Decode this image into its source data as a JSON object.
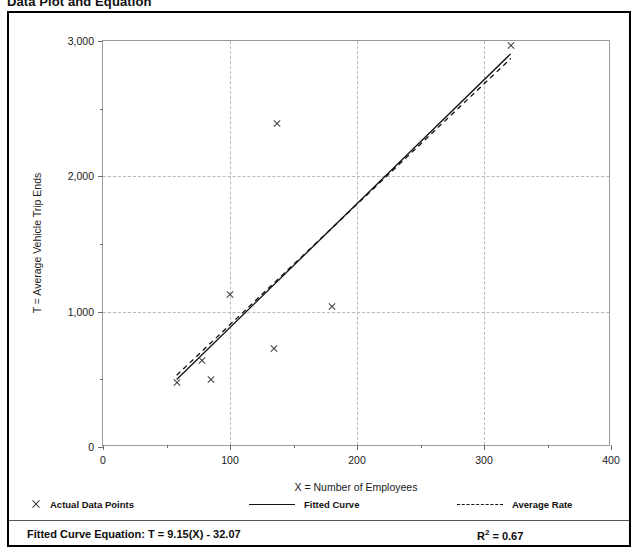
{
  "title": "Data Plot and Equation",
  "axes": {
    "x_title": "X = Number of Employees",
    "y_title": "T = Average Vehicle Trip Ends",
    "x_ticks": [
      "0",
      "100",
      "200",
      "300",
      "400"
    ],
    "y_ticks": [
      "0",
      "1,000",
      "2,000",
      "3,000"
    ]
  },
  "legend": {
    "items": [
      {
        "label": "Actual Data Points",
        "marker": "x-marker"
      },
      {
        "label": "Fitted Curve",
        "marker": "solid-line"
      },
      {
        "label": "Average Rate",
        "marker": "dashed-line"
      }
    ]
  },
  "footer": {
    "equation_label": "Fitted Curve Equation:  T = 9.15(X) - 32.07",
    "r2_label": "R",
    "r2_sup": "2",
    "r2_value": " = 0.67"
  },
  "chart_data": {
    "type": "scatter",
    "title": "Data Plot and Equation",
    "xlabel": "X = Number of Employees",
    "ylabel": "T = Average Vehicle Trip Ends",
    "xlim": [
      0,
      400
    ],
    "ylim": [
      0,
      3000
    ],
    "x_major_ticks": [
      0,
      100,
      200,
      300,
      400
    ],
    "y_major_ticks": [
      0,
      1000,
      2000,
      3000
    ],
    "x_minor_ticks": [
      50,
      150,
      250,
      350
    ],
    "y_minor_ticks": [
      500,
      1500,
      2500
    ],
    "grid": "dashed gridlines at x=100,200,300 and y=1000,2000",
    "legend_position": "below-plot",
    "series": [
      {
        "name": "Actual Data Points",
        "type": "scatter",
        "marker": "x",
        "points": [
          {
            "x": 58,
            "y": 480
          },
          {
            "x": 78,
            "y": 640
          },
          {
            "x": 85,
            "y": 500
          },
          {
            "x": 100,
            "y": 1130
          },
          {
            "x": 135,
            "y": 730
          },
          {
            "x": 137,
            "y": 2390
          },
          {
            "x": 180,
            "y": 1035
          },
          {
            "x": 321,
            "y": 2970
          }
        ]
      },
      {
        "name": "Fitted Curve",
        "type": "line",
        "style": "solid",
        "equation": "T = 9.15(X) - 32.07",
        "r_squared": 0.67,
        "endpoints": [
          {
            "x": 58,
            "y": 499
          },
          {
            "x": 321,
            "y": 2905
          }
        ]
      },
      {
        "name": "Average Rate",
        "type": "line",
        "style": "dashed",
        "endpoints": [
          {
            "x": 58,
            "y": 530
          },
          {
            "x": 321,
            "y": 2870
          }
        ]
      }
    ]
  }
}
